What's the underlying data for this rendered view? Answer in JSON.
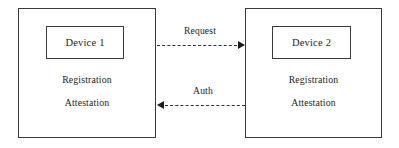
{
  "diagram": {
    "type": "device-attestation-flow",
    "nodes": [
      {
        "id": "device-1",
        "title": "Device 1",
        "lines": [
          "Registration",
          "Attestation"
        ]
      },
      {
        "id": "device-2",
        "title": "Device 2",
        "lines": [
          "Registration",
          "Attestation"
        ]
      }
    ],
    "connectors": [
      {
        "id": "request",
        "label": "Request",
        "from": "device-1",
        "to": "device-2",
        "direction": "right",
        "style": "dashed"
      },
      {
        "id": "auth",
        "label": "Auth",
        "from": "device-2",
        "to": "device-1",
        "direction": "left",
        "style": "dashed"
      }
    ]
  },
  "colors": {
    "stroke": "#3a3a3a",
    "text": "#1c1c1c",
    "background": "#ffffff",
    "connector": "#2e2e2e"
  }
}
